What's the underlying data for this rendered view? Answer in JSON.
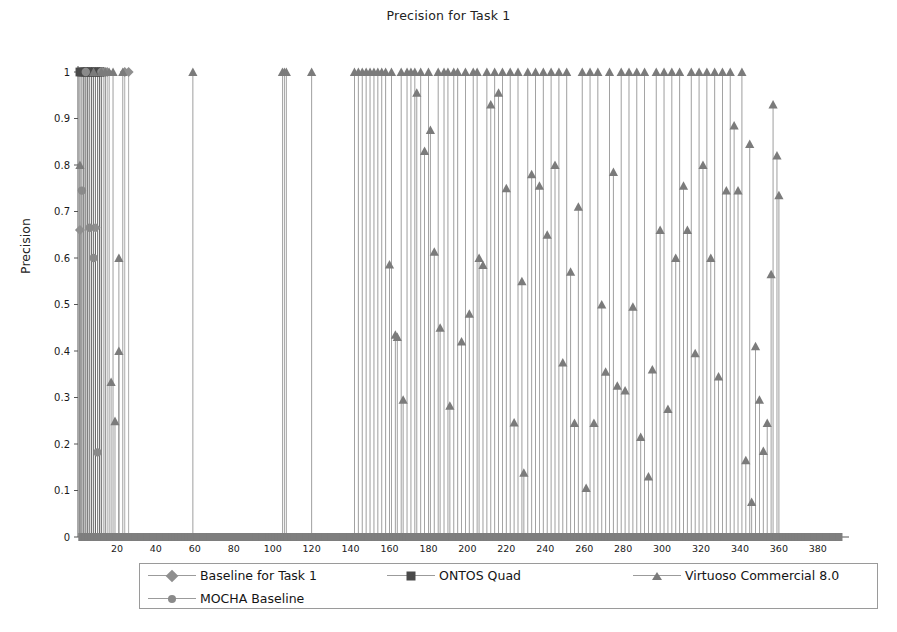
{
  "chart_data": {
    "type": "scatter",
    "title": "Precision for Task 1",
    "xlabel": "",
    "ylabel": "Precision",
    "xlim": [
      0,
      396
    ],
    "ylim": [
      0,
      1
    ],
    "grid": false,
    "legend_position": "bottom",
    "xticks": [
      20,
      40,
      60,
      80,
      100,
      120,
      140,
      160,
      180,
      200,
      220,
      240,
      260,
      280,
      300,
      320,
      340,
      360,
      380
    ],
    "yticks": [
      "0",
      "0.1",
      "0.2",
      "0.3",
      "0.4",
      "0.5",
      "0.6",
      "0.7",
      "0.8",
      "0.9",
      "1"
    ],
    "style": "stem",
    "series": [
      {
        "name": "Baseline for Task 1",
        "marker": "diamond",
        "color": "#8f8f8f",
        "points": [
          [
            1,
            0.66
          ],
          [
            3,
            1.0
          ],
          [
            5,
            1.0
          ],
          [
            7,
            1.0
          ],
          [
            9,
            0.665
          ],
          [
            11,
            1.0
          ],
          [
            13,
            1.0
          ],
          [
            15,
            1.0
          ],
          [
            24,
            1.0
          ],
          [
            26,
            1.0
          ]
        ]
      },
      {
        "name": "ONTOS Quad",
        "marker": "square",
        "color": "#4a4a4a",
        "points": [
          [
            1,
            1.0
          ],
          [
            2,
            1.0
          ],
          [
            3,
            1.0
          ],
          [
            4,
            1.0
          ],
          [
            5,
            1.0
          ],
          [
            6,
            1.0
          ],
          [
            7,
            1.0
          ],
          [
            8,
            1.0
          ],
          [
            9,
            1.0
          ],
          [
            10,
            1.0
          ],
          [
            11,
            1.0
          ],
          [
            12,
            1.0
          ]
        ]
      },
      {
        "name": "MOCHA Baseline",
        "marker": "circle",
        "color": "#8a8a8a",
        "points": [
          [
            2,
            0.745
          ],
          [
            4,
            1.0
          ],
          [
            6,
            0.665
          ],
          [
            8,
            0.6
          ],
          [
            10,
            0.182
          ],
          [
            12,
            1.0
          ],
          [
            14,
            1.0
          ]
        ]
      },
      {
        "name": "Virtuoso Commercial 8.0",
        "marker": "triangle",
        "color": "#7b7b7b",
        "points": [
          [
            1,
            0.8
          ],
          [
            8,
            1.0
          ],
          [
            12,
            1.0
          ],
          [
            14,
            1.0
          ],
          [
            16,
            1.0
          ],
          [
            18,
            1.0
          ],
          [
            17,
            0.333
          ],
          [
            19,
            0.249
          ],
          [
            21,
            0.6
          ],
          [
            21,
            0.4
          ],
          [
            23,
            1.0
          ],
          [
            59,
            1.0
          ],
          [
            105,
            1.0
          ],
          [
            106,
            1.0
          ],
          [
            107,
            1.0
          ],
          [
            120,
            1.0
          ],
          [
            142,
            1.0
          ],
          [
            144,
            1.0
          ],
          [
            146,
            1.0
          ],
          [
            148,
            1.0
          ],
          [
            150,
            1.0
          ],
          [
            152,
            1.0
          ],
          [
            154,
            1.0
          ],
          [
            156,
            1.0
          ],
          [
            158,
            1.0
          ],
          [
            160,
            0.586
          ],
          [
            161,
            1.0
          ],
          [
            163,
            0.435
          ],
          [
            164,
            0.43
          ],
          [
            166,
            1.0
          ],
          [
            167,
            0.295
          ],
          [
            169,
            1.0
          ],
          [
            171,
            1.0
          ],
          [
            173,
            1.0
          ],
          [
            174,
            0.955
          ],
          [
            176,
            1.0
          ],
          [
            178,
            0.83
          ],
          [
            180,
            1.0
          ],
          [
            181,
            0.875
          ],
          [
            183,
            0.613
          ],
          [
            185,
            1.0
          ],
          [
            186,
            0.45
          ],
          [
            188,
            1.0
          ],
          [
            190,
            1.0
          ],
          [
            191,
            0.282
          ],
          [
            193,
            1.0
          ],
          [
            195,
            1.0
          ],
          [
            197,
            0.42
          ],
          [
            199,
            1.0
          ],
          [
            201,
            0.48
          ],
          [
            203,
            1.0
          ],
          [
            205,
            1.0
          ],
          [
            206,
            0.6
          ],
          [
            208,
            0.585
          ],
          [
            210,
            1.0
          ],
          [
            212,
            0.93
          ],
          [
            214,
            1.0
          ],
          [
            216,
            0.955
          ],
          [
            218,
            1.0
          ],
          [
            220,
            0.75
          ],
          [
            222,
            1.0
          ],
          [
            224,
            0.246
          ],
          [
            226,
            1.0
          ],
          [
            228,
            0.55
          ],
          [
            229,
            0.138
          ],
          [
            231,
            1.0
          ],
          [
            233,
            0.78
          ],
          [
            235,
            1.0
          ],
          [
            237,
            0.755
          ],
          [
            239,
            1.0
          ],
          [
            241,
            0.65
          ],
          [
            243,
            1.0
          ],
          [
            245,
            0.8
          ],
          [
            247,
            1.0
          ],
          [
            249,
            0.375
          ],
          [
            251,
            1.0
          ],
          [
            253,
            0.57
          ],
          [
            255,
            0.245
          ],
          [
            257,
            0.71
          ],
          [
            259,
            1.0
          ],
          [
            261,
            0.105
          ],
          [
            263,
            1.0
          ],
          [
            265,
            0.245
          ],
          [
            267,
            1.0
          ],
          [
            269,
            0.5
          ],
          [
            271,
            0.355
          ],
          [
            273,
            1.0
          ],
          [
            275,
            0.785
          ],
          [
            277,
            0.325
          ],
          [
            279,
            1.0
          ],
          [
            281,
            0.315
          ],
          [
            283,
            1.0
          ],
          [
            285,
            0.495
          ],
          [
            287,
            1.0
          ],
          [
            289,
            0.215
          ],
          [
            291,
            1.0
          ],
          [
            293,
            0.13
          ],
          [
            295,
            0.36
          ],
          [
            297,
            1.0
          ],
          [
            299,
            0.66
          ],
          [
            301,
            1.0
          ],
          [
            303,
            0.275
          ],
          [
            305,
            1.0
          ],
          [
            307,
            0.6
          ],
          [
            309,
            1.0
          ],
          [
            311,
            0.755
          ],
          [
            313,
            0.66
          ],
          [
            315,
            1.0
          ],
          [
            317,
            0.395
          ],
          [
            319,
            1.0
          ],
          [
            321,
            0.8
          ],
          [
            323,
            1.0
          ],
          [
            325,
            0.6
          ],
          [
            327,
            1.0
          ],
          [
            329,
            0.345
          ],
          [
            331,
            1.0
          ],
          [
            333,
            0.745
          ],
          [
            335,
            1.0
          ],
          [
            337,
            0.885
          ],
          [
            339,
            0.745
          ],
          [
            341,
            1.0
          ],
          [
            343,
            0.165
          ],
          [
            345,
            0.845
          ],
          [
            346,
            0.075
          ],
          [
            348,
            0.41
          ],
          [
            350,
            0.295
          ],
          [
            352,
            0.185
          ],
          [
            354,
            0.245
          ],
          [
            356,
            0.565
          ],
          [
            357,
            0.93
          ],
          [
            359,
            0.82
          ],
          [
            360,
            0.735
          ]
        ]
      }
    ]
  },
  "legend": {
    "entries": [
      {
        "label": "Baseline for Task 1",
        "marker": "diamond"
      },
      {
        "label": "ONTOS Quad",
        "marker": "square"
      },
      {
        "label": "Virtuoso Commercial 8.0",
        "marker": "triangle"
      },
      {
        "label": "MOCHA Baseline",
        "marker": "circle"
      }
    ]
  }
}
